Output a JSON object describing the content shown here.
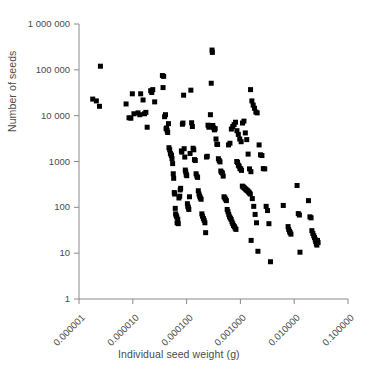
{
  "chart_data": {
    "type": "scatter",
    "title": "",
    "xlabel": "Individual seed weight (g)",
    "ylabel": "Number of seeds",
    "xscale": "log",
    "yscale": "log",
    "xlim": [
      1e-06,
      0.1
    ],
    "ylim": [
      1,
      1000000
    ],
    "grid": false,
    "legend": null,
    "xticks": [
      1e-06,
      1e-05,
      0.0001,
      0.001,
      0.01,
      0.1
    ],
    "xticklabels": [
      "0.000001",
      "0.000010",
      "0.000100",
      "0.001000",
      "0.010000",
      "0.100000"
    ],
    "yticks": [
      1,
      10,
      100,
      1000,
      10000,
      100000,
      1000000
    ],
    "yticklabels": [
      "1",
      "10",
      "100",
      "1000",
      "10 000",
      "100 000",
      "1 000 000"
    ],
    "marker": "square",
    "marker_color": "#000000",
    "marker_size": 5,
    "points": [
      [
        2.5e-06,
        120000
      ],
      [
        1.8e-06,
        23000
      ],
      [
        2.1e-06,
        21000
      ],
      [
        2.4e-06,
        16000
      ],
      [
        7.5e-06,
        18000
      ],
      [
        8.5e-06,
        9000
      ],
      [
        9.2e-06,
        8800
      ],
      [
        1.05e-05,
        11000
      ],
      [
        1.25e-05,
        11500
      ],
      [
        1.35e-05,
        10500
      ],
      [
        1.4e-05,
        30000
      ],
      [
        1.55e-05,
        22000
      ],
      [
        1.65e-05,
        11000
      ],
      [
        1.75e-05,
        11800
      ],
      [
        1.85e-05,
        5600
      ],
      [
        9.8e-06,
        30000
      ],
      [
        2.15e-05,
        35000
      ],
      [
        2.25e-05,
        32000
      ],
      [
        2.35e-05,
        37000
      ],
      [
        2.55e-05,
        20000
      ],
      [
        3.55e-05,
        75000
      ],
      [
        3.75e-05,
        72000
      ],
      [
        3.65e-05,
        41000
      ],
      [
        3.9e-05,
        9500
      ],
      [
        4.05e-05,
        10500
      ],
      [
        4.15e-05,
        5200
      ],
      [
        4.25e-05,
        5400
      ],
      [
        4.35e-05,
        4700
      ],
      [
        4.45e-05,
        4300
      ],
      [
        4.6e-05,
        6700
      ],
      [
        4.7e-05,
        2000
      ],
      [
        4.85e-05,
        1800
      ],
      [
        5e-05,
        1500
      ],
      [
        5.15e-05,
        1400
      ],
      [
        5.25e-05,
        1350
      ],
      [
        5.35e-05,
        1150
      ],
      [
        5.5e-05,
        900
      ],
      [
        5.65e-05,
        540
      ],
      [
        5.75e-05,
        430
      ],
      [
        5.9e-05,
        210
      ],
      [
        6e-05,
        195
      ],
      [
        6.15e-05,
        95
      ],
      [
        6.25e-05,
        72
      ],
      [
        6.4e-05,
        66
      ],
      [
        6.55e-05,
        62
      ],
      [
        6.65e-05,
        46
      ],
      [
        6.85e-05,
        55
      ],
      [
        7e-05,
        44
      ],
      [
        7.2e-05,
        160
      ],
      [
        7.45e-05,
        175
      ],
      [
        7.6e-05,
        240
      ],
      [
        7.75e-05,
        260
      ],
      [
        8e-05,
        1700
      ],
      [
        8.15e-05,
        1600
      ],
      [
        8.35e-05,
        6500
      ],
      [
        8.55e-05,
        6900
      ],
      [
        8.8e-05,
        28000
      ],
      [
        9e-05,
        1900
      ],
      [
        9.25e-05,
        1250
      ],
      [
        9.45e-05,
        650
      ],
      [
        9.65e-05,
        590
      ],
      [
        9.85e-05,
        520
      ],
      [
        0.0001005,
        490
      ],
      [
        0.0001035,
        120
      ],
      [
        0.0001055,
        105
      ],
      [
        0.000108,
        98
      ],
      [
        0.00011,
        90
      ],
      [
        0.000113,
        170
      ],
      [
        0.000116,
        1500
      ],
      [
        0.00012,
        36000
      ],
      [
        0.000124,
        7000
      ],
      [
        0.000128,
        5800
      ],
      [
        0.000132,
        1950
      ],
      [
        0.000136,
        1800
      ],
      [
        0.00014,
        1100
      ],
      [
        0.000145,
        1050
      ],
      [
        0.00015,
        540
      ],
      [
        0.000155,
        480
      ],
      [
        0.00016,
        450
      ],
      [
        0.000165,
        230
      ],
      [
        0.00017,
        195
      ],
      [
        0.000175,
        175
      ],
      [
        0.00018,
        160
      ],
      [
        0.000186,
        150
      ],
      [
        0.000192,
        72
      ],
      [
        0.000198,
        64
      ],
      [
        0.000205,
        57
      ],
      [
        0.000212,
        52
      ],
      [
        0.000219,
        46
      ],
      [
        0.000226,
        28
      ],
      [
        0.000234,
        1250
      ],
      [
        0.000242,
        1300
      ],
      [
        0.00025,
        6200
      ],
      [
        0.000259,
        5600
      ],
      [
        0.000268,
        5900
      ],
      [
        0.000277,
        10500
      ],
      [
        0.000287,
        51000
      ],
      [
        0.000297,
        270000
      ],
      [
        0.000301,
        240000
      ],
      [
        0.000307,
        6100
      ],
      [
        0.000318,
        5400
      ],
      [
        0.000329,
        4900
      ],
      [
        0.00034,
        5200
      ],
      [
        0.000352,
        3100
      ],
      [
        0.000364,
        2400
      ],
      [
        0.000377,
        2350
      ],
      [
        0.00039,
        1150
      ],
      [
        0.000404,
        1050
      ],
      [
        0.000418,
        980
      ],
      [
        0.000432,
        620
      ],
      [
        0.000447,
        580
      ],
      [
        0.000463,
        560
      ],
      [
        0.000479,
        480
      ],
      [
        0.000496,
        170
      ],
      [
        0.000513,
        160
      ],
      [
        0.00053,
        150
      ],
      [
        0.000549,
        140
      ],
      [
        0.000568,
        90
      ],
      [
        0.000588,
        80
      ],
      [
        0.000608,
        70
      ],
      [
        0.000629,
        62
      ],
      [
        0.000651,
        58
      ],
      [
        0.000674,
        54
      ],
      [
        0.000697,
        48
      ],
      [
        0.000721,
        44
      ],
      [
        0.000746,
        40
      ],
      [
        0.000772,
        38
      ],
      [
        0.000799,
        35
      ],
      [
        0.000827,
        33
      ],
      [
        0.000856,
        1000
      ],
      [
        0.000885,
        950
      ],
      [
        0.000916,
        830
      ],
      [
        0.000948,
        790
      ],
      [
        0.00098,
        700
      ],
      [
        0.001014,
        690
      ],
      [
        0.001049,
        640
      ],
      [
        0.001086,
        290
      ],
      [
        0.001124,
        280
      ],
      [
        0.001163,
        270
      ],
      [
        0.001203,
        260
      ],
      [
        0.001245,
        250
      ],
      [
        0.001288,
        240
      ],
      [
        0.001333,
        235
      ],
      [
        0.00138,
        225
      ],
      [
        0.001428,
        215
      ],
      [
        0.001477,
        205
      ],
      [
        0.001528,
        195
      ],
      [
        0.001582,
        19
      ],
      [
        0.000602,
        2300
      ],
      [
        0.000639,
        2500
      ],
      [
        0.000679,
        5100
      ],
      [
        0.000721,
        5800
      ],
      [
        0.000765,
        6400
      ],
      [
        0.000812,
        7200
      ],
      [
        0.000862,
        4700
      ],
      [
        0.000915,
        3900
      ],
      [
        0.000972,
        3100
      ],
      [
        0.001032,
        2700
      ],
      [
        0.001095,
        6900
      ],
      [
        0.001163,
        7600
      ],
      [
        0.001235,
        4200
      ],
      [
        0.001311,
        3000
      ],
      [
        0.001392,
        1450
      ],
      [
        0.001478,
        690
      ],
      [
        0.001569,
        600
      ],
      [
        0.001666,
        155
      ],
      [
        0.001769,
        105
      ],
      [
        0.001878,
        70
      ],
      [
        0.001994,
        46
      ],
      [
        0.002117,
        11
      ],
      [
        0.001545,
        37000
      ],
      [
        0.001635,
        21000
      ],
      [
        0.001729,
        17000
      ],
      [
        0.001831,
        14500
      ],
      [
        0.001938,
        12000
      ],
      [
        0.002051,
        11500
      ],
      [
        0.002226,
        2300
      ],
      [
        0.002364,
        1400
      ],
      [
        0.002512,
        1350
      ],
      [
        0.002667,
        700
      ],
      [
        0.002833,
        690
      ],
      [
        0.003008,
        105
      ],
      [
        0.003195,
        85
      ],
      [
        0.00339,
        44
      ],
      [
        0.00362,
        6.5
      ],
      [
        0.00626,
        110
      ],
      [
        0.0077,
        38
      ],
      [
        0.0079,
        33
      ],
      [
        0.0082,
        30
      ],
      [
        0.0084,
        28
      ],
      [
        0.0087,
        26
      ],
      [
        0.0113,
        300
      ],
      [
        0.0119,
        73
      ],
      [
        0.0125,
        68
      ],
      [
        0.0128,
        10.5
      ],
      [
        0.0184,
        140
      ],
      [
        0.0196,
        62
      ],
      [
        0.0206,
        59
      ],
      [
        0.0213,
        31
      ],
      [
        0.0222,
        27
      ],
      [
        0.0231,
        24
      ],
      [
        0.0238,
        22
      ],
      [
        0.0245,
        20
      ],
      [
        0.0251,
        18
      ],
      [
        0.0258,
        16
      ],
      [
        0.0264,
        15
      ],
      [
        0.0271,
        19
      ],
      [
        0.0278,
        17
      ]
    ]
  }
}
